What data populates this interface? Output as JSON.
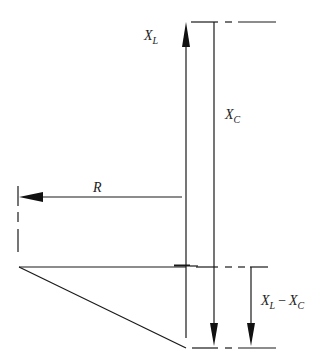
{
  "diagram": {
    "type": "impedance phasor diagram",
    "labels": {
      "xl": {
        "main": "X",
        "sub": "L"
      },
      "xc": {
        "main": "X",
        "sub": "C"
      },
      "r": "R",
      "diff": {
        "a_main": "X",
        "a_sub": "L",
        "op": "−",
        "b_main": "X",
        "b_sub": "C"
      }
    },
    "colors": {
      "stroke": "#1a1a1a",
      "text": "#222222"
    }
  }
}
